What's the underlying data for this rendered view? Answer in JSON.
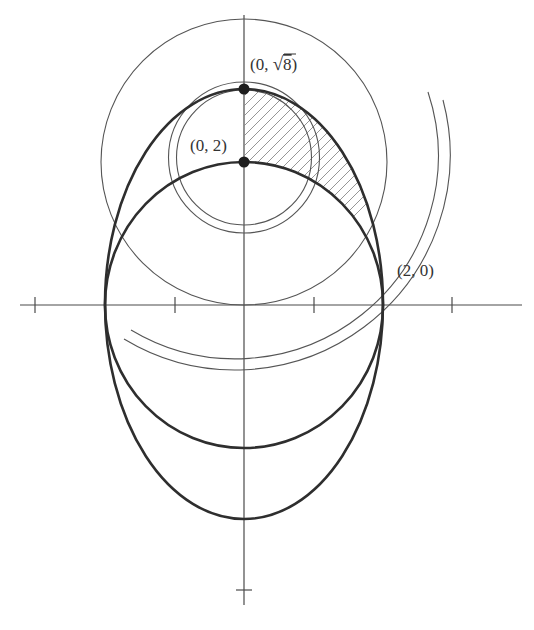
{
  "figure": {
    "labels": {
      "top_point": "(0, ",
      "top_point_radical": "√",
      "top_point_radicand": "8",
      "top_point_close": ")",
      "mid_point": "(0, 2)",
      "right_point": "(2, 0)"
    },
    "points": [
      {
        "name": "(0, √8)",
        "x": 0,
        "y": 2.828
      },
      {
        "name": "(0, 2)",
        "x": 0,
        "y": 2
      },
      {
        "name": "(2, 0)",
        "x": 2,
        "y": 0
      }
    ],
    "curves": [
      {
        "name": "ellipse",
        "style": "thick",
        "center": [
          0,
          0
        ],
        "semi_x": 2,
        "semi_y": 2.828
      },
      {
        "name": "circle-radius-2",
        "style": "thick",
        "center": [
          0,
          0
        ],
        "radius": 2
      },
      {
        "name": "large-thin-circle",
        "style": "thin",
        "center": [
          0,
          2
        ],
        "radius": 2
      },
      {
        "name": "small-circle-outer",
        "style": "thin",
        "center": [
          0,
          2.1
        ],
        "radius": 1.08
      },
      {
        "name": "small-circle-inner",
        "style": "thin",
        "center": [
          0,
          2.1
        ],
        "radius": 0.97
      },
      {
        "name": "arc-inner",
        "style": "thin"
      },
      {
        "name": "arc-outer",
        "style": "thin"
      }
    ],
    "shaded_region": "area between ellipse and circle in first quadrant, hatched",
    "axes": {
      "x_ticks": [
        -3,
        -1,
        1,
        3
      ],
      "y_ticks": [
        -4
      ]
    }
  }
}
